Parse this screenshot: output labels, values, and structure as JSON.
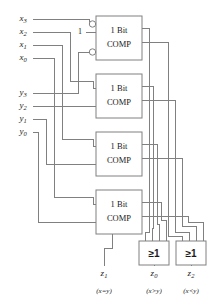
{
  "diagram": {
    "colors": {
      "wire": "#808080",
      "text": "#1a1a1a",
      "background": "#ffffff"
    },
    "blocks": [
      {
        "id": "comp3",
        "line1": "1 Bit",
        "line2": "COMP",
        "x": 96,
        "y": 16,
        "w": 46,
        "h": 44,
        "inverted_inputs": true
      },
      {
        "id": "comp2",
        "line1": "1 Bit",
        "line2": "COMP",
        "x": 96,
        "y": 74,
        "w": 46,
        "h": 44,
        "inverted_inputs": false
      },
      {
        "id": "comp1",
        "line1": "1 Bit",
        "line2": "COMP",
        "x": 96,
        "y": 132,
        "w": 46,
        "h": 44,
        "inverted_inputs": false
      },
      {
        "id": "comp0",
        "line1": "1 Bit",
        "line2": "COMP",
        "x": 96,
        "y": 190,
        "w": 46,
        "h": 44,
        "inverted_inputs": false
      }
    ],
    "or_gates": [
      {
        "id": "or-gt",
        "label": "≥1",
        "x": 139,
        "y": 241,
        "w": 30,
        "h": 24
      },
      {
        "id": "or-lt",
        "label": "≥1",
        "x": 176,
        "y": 241,
        "w": 30,
        "h": 24
      }
    ],
    "constant": {
      "label": "1",
      "x": 80,
      "y": 32
    },
    "inputs_x": [
      {
        "name": "x",
        "sub": "3",
        "x": 23,
        "y": 19
      },
      {
        "name": "x",
        "sub": "2",
        "x": 23,
        "y": 32
      },
      {
        "name": "x",
        "sub": "1",
        "x": 23,
        "y": 45
      },
      {
        "name": "x",
        "sub": "0",
        "x": 23,
        "y": 58
      }
    ],
    "inputs_y": [
      {
        "name": "y",
        "sub": "3",
        "x": 23,
        "y": 93
      },
      {
        "name": "y",
        "sub": "2",
        "x": 23,
        "y": 106
      },
      {
        "name": "y",
        "sub": "1",
        "x": 23,
        "y": 119
      },
      {
        "name": "y",
        "sub": "0",
        "x": 23,
        "y": 132
      }
    ],
    "outputs": [
      {
        "id": "z1",
        "name": "z",
        "sub": "1",
        "relation": "(x=y)",
        "x": 104,
        "y": 274,
        "paren_y": 291
      },
      {
        "id": "z0",
        "name": "z",
        "sub": "0",
        "relation": "(x>y)",
        "x": 154,
        "y": 274,
        "paren_y": 291
      },
      {
        "id": "z2",
        "name": "z",
        "sub": "2",
        "relation": "(x<y)",
        "x": 191,
        "y": 274,
        "paren_y": 291
      }
    ]
  }
}
